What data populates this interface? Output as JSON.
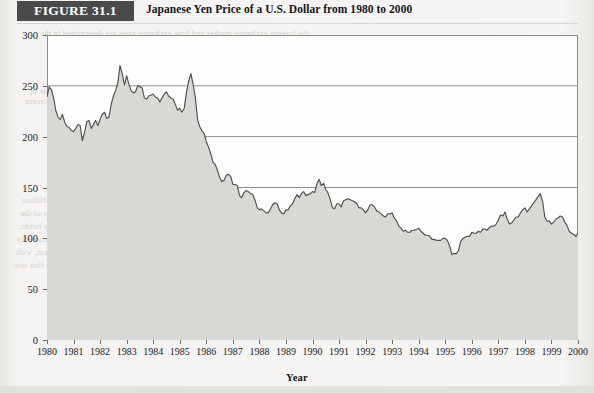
{
  "figure": {
    "badge_label": "FIGURE 31.1",
    "caption": "Japanese Yen Price of a U.S. Dollar from 1980 to 2000"
  },
  "colors": {
    "badge_background": "#4a4a4a",
    "badge_text": "#ffffff",
    "page_background": "#f3f2f0",
    "plot_background": "#fdfdfc",
    "area_fill": "#d9d8d4",
    "line": "#4f4e4c",
    "gridline": "#8e8c89",
    "axis": "#8e8c89",
    "bleed_text": "#cfcdc9"
  },
  "bleed_through": {
    "title": "31.2  Foreign Exchange Markets and Exchange Rates",
    "lines": [
      "the foreign exchange market and how exchange rates are determined in the",
      "market and the factors that cause exchange rates to change over time.",
      "the currency of one country is traded for the currency of another. Trade in",
      "foreign exchange markets is enormous and has grown rapidly in recent",
      "the daily turnover in foreign exchange markets exceeded $1,500 billion",
      "of currency transactions are made in the major financial centers of the",
      "London, New York, and Tokyo. These transactions are carried out by banks,",
      "firms, and governments. The dollar is the most commonly traded currency",
      "about 90 percent of all transactions. The yen and the euro are next, with",
      "respectively. It is a foreign exchange market of enormous scale that sets"
    ]
  },
  "chart_data": {
    "type": "area",
    "title": "Japanese Yen Price of a U.S. Dollar from 1980 to 2000",
    "xlabel": "Year",
    "ylabel": "",
    "xlim": [
      1980,
      2000
    ],
    "ylim": [
      0,
      300
    ],
    "yticks": [
      0,
      50,
      100,
      150,
      200,
      250,
      300
    ],
    "gridlines": [
      150,
      200,
      250
    ],
    "grid": true,
    "legend": null,
    "xticks": [
      1980,
      1981,
      1982,
      1983,
      1984,
      1985,
      1986,
      1987,
      1988,
      1989,
      1990,
      1991,
      1992,
      1993,
      1994,
      1995,
      1996,
      1997,
      1998,
      1999,
      2000
    ],
    "series": [
      {
        "name": "Japanese Yen per U.S. Dollar",
        "x": [
          1980.0,
          1980.08,
          1980.17,
          1980.25,
          1980.33,
          1980.42,
          1980.5,
          1980.58,
          1980.67,
          1980.75,
          1980.83,
          1980.92,
          1981.0,
          1981.08,
          1981.17,
          1981.25,
          1981.33,
          1981.42,
          1981.5,
          1981.58,
          1981.67,
          1981.75,
          1981.83,
          1981.92,
          1982.0,
          1982.08,
          1982.17,
          1982.25,
          1982.33,
          1982.42,
          1982.5,
          1982.58,
          1982.67,
          1982.75,
          1982.83,
          1982.92,
          1983.0,
          1983.08,
          1983.17,
          1983.25,
          1983.33,
          1983.42,
          1983.5,
          1983.58,
          1983.67,
          1983.75,
          1983.83,
          1983.92,
          1984.0,
          1984.08,
          1984.17,
          1984.25,
          1984.33,
          1984.42,
          1984.5,
          1984.58,
          1984.67,
          1984.75,
          1984.83,
          1984.92,
          1985.0,
          1985.08,
          1985.17,
          1985.25,
          1985.33,
          1985.42,
          1985.5,
          1985.58,
          1985.67,
          1985.75,
          1985.83,
          1985.92,
          1986.0,
          1986.08,
          1986.17,
          1986.25,
          1986.33,
          1986.42,
          1986.5,
          1986.58,
          1986.67,
          1986.75,
          1986.83,
          1986.92,
          1987.0,
          1987.08,
          1987.17,
          1987.25,
          1987.33,
          1987.42,
          1987.5,
          1987.58,
          1987.67,
          1987.75,
          1987.83,
          1987.92,
          1988.0,
          1988.08,
          1988.17,
          1988.25,
          1988.33,
          1988.42,
          1988.5,
          1988.58,
          1988.67,
          1988.75,
          1988.83,
          1988.92,
          1989.0,
          1989.08,
          1989.17,
          1989.25,
          1989.33,
          1989.42,
          1989.5,
          1989.58,
          1989.67,
          1989.75,
          1989.83,
          1989.92,
          1990.0,
          1990.08,
          1990.17,
          1990.25,
          1990.33,
          1990.42,
          1990.5,
          1990.58,
          1990.67,
          1990.75,
          1990.83,
          1990.92,
          1991.0,
          1991.08,
          1991.17,
          1991.25,
          1991.33,
          1991.42,
          1991.5,
          1991.58,
          1991.67,
          1991.75,
          1991.83,
          1991.92,
          1992.0,
          1992.08,
          1992.17,
          1992.25,
          1992.33,
          1992.42,
          1992.5,
          1992.58,
          1992.67,
          1992.75,
          1992.83,
          1992.92,
          1993.0,
          1993.08,
          1993.17,
          1993.25,
          1993.33,
          1993.42,
          1993.5,
          1993.58,
          1993.67,
          1993.75,
          1993.83,
          1993.92,
          1994.0,
          1994.08,
          1994.17,
          1994.25,
          1994.33,
          1994.42,
          1994.5,
          1994.58,
          1994.67,
          1994.75,
          1994.83,
          1994.92,
          1995.0,
          1995.08,
          1995.17,
          1995.25,
          1995.33,
          1995.42,
          1995.5,
          1995.58,
          1995.67,
          1995.75,
          1995.83,
          1995.92,
          1996.0,
          1996.08,
          1996.17,
          1996.25,
          1996.33,
          1996.42,
          1996.5,
          1996.58,
          1996.67,
          1996.75,
          1996.83,
          1996.92,
          1997.0,
          1997.08,
          1997.17,
          1997.25,
          1997.33,
          1997.42,
          1997.5,
          1997.58,
          1997.67,
          1997.75,
          1997.83,
          1997.92,
          1998.0,
          1998.08,
          1998.17,
          1998.25,
          1998.33,
          1998.42,
          1998.5,
          1998.58,
          1998.67,
          1998.75,
          1998.83,
          1998.92,
          1999.0,
          1999.08,
          1999.17,
          1999.25,
          1999.33,
          1999.42,
          1999.5,
          1999.58,
          1999.67,
          1999.75,
          1999.83,
          1999.92,
          2000.0
        ],
        "values": [
          239,
          249,
          246,
          238,
          226,
          219,
          217,
          222,
          214,
          210,
          209,
          206,
          205,
          208,
          212,
          211,
          196,
          205,
          215,
          216,
          208,
          212,
          216,
          211,
          217,
          222,
          224,
          218,
          219,
          232,
          240,
          245,
          253,
          270,
          262,
          251,
          260,
          252,
          245,
          243,
          244,
          250,
          249,
          248,
          238,
          237,
          240,
          241,
          242,
          239,
          238,
          234,
          238,
          242,
          244,
          240,
          238,
          237,
          232,
          226,
          228,
          224,
          228,
          243,
          254,
          262,
          252,
          240,
          217,
          210,
          206,
          203,
          195,
          190,
          183,
          175,
          173,
          167,
          160,
          156,
          157,
          162,
          163,
          161,
          153,
          153,
          152,
          142,
          140,
          145,
          147,
          146,
          144,
          143,
          138,
          130,
          128,
          129,
          127,
          125,
          125,
          129,
          133,
          135,
          134,
          128,
          125,
          124,
          128,
          128,
          132,
          134,
          139,
          143,
          140,
          144,
          146,
          142,
          143,
          144,
          146,
          145,
          154,
          158,
          152,
          154,
          148,
          145,
          138,
          130,
          129,
          134,
          134,
          131,
          137,
          138,
          139,
          138,
          137,
          136,
          134,
          130,
          130,
          128,
          125,
          128,
          133,
          133,
          131,
          127,
          126,
          124,
          122,
          121,
          124,
          124,
          125,
          120,
          117,
          112,
          110,
          107,
          108,
          106,
          106,
          108,
          108,
          109,
          110,
          107,
          105,
          103,
          103,
          102,
          99,
          99,
          98,
          98,
          98,
          100,
          100,
          98,
          92,
          84,
          85,
          85,
          88,
          97,
          100,
          101,
          102,
          102,
          106,
          105,
          105,
          107,
          106,
          109,
          109,
          108,
          111,
          112,
          112,
          114,
          118,
          123,
          122,
          126,
          119,
          114,
          115,
          118,
          121,
          121,
          125,
          128,
          130,
          126,
          129,
          132,
          135,
          138,
          141,
          144,
          136,
          121,
          117,
          117,
          114,
          116,
          119,
          120,
          122,
          121,
          116,
          113,
          107,
          105,
          104,
          102,
          105
        ]
      }
    ]
  }
}
